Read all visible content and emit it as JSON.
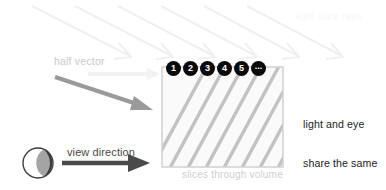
{
  "figure": {
    "background_color": "#ffffff"
  },
  "labels": {
    "half_vector": "half vector",
    "light_slice_rays": "light slice rays",
    "slices_through_volume": "slices through volume",
    "view_direction": "view direction"
  },
  "annotation": {
    "line1": "light and eye",
    "line2": "share the same",
    "line3": "front-to-back",
    "line4": "slice order"
  },
  "slice_badges": [
    {
      "label": "1"
    },
    {
      "label": "2"
    },
    {
      "label": "3"
    },
    {
      "label": "4"
    },
    {
      "label": "5"
    },
    {
      "label": "..."
    }
  ],
  "colors": {
    "badge_fill": "#0a0a0a",
    "badge_text": "#ffffff",
    "slice_stripe": "#c2c2c2",
    "volume_fill": "#fafafa",
    "volume_border": "#d6d6d6",
    "light_ray": "#f0f0f0",
    "half_vector_arrow": "#9a9a9a",
    "view_arrow": "#4a4a4a",
    "annotation_text": "#1c1c1c",
    "faint_text": "#cfcfcf"
  },
  "icons": {
    "eye": "eye-icon",
    "light_ray_arrow": "arrow-down-right-icon",
    "half_vector_arrow": "arrow-down-right-icon",
    "view_direction_arrow": "arrow-right-icon"
  }
}
